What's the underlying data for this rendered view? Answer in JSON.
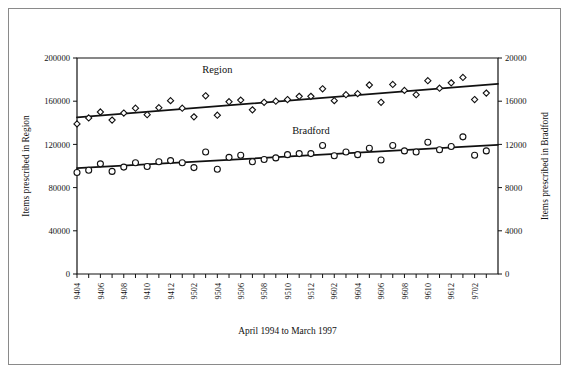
{
  "figure": {
    "xlabel": "April 1994 to March 1997",
    "ylabel_left": "Items prescribed in Region",
    "ylabel_right": "Items prescribed in Bradford",
    "series_label_region": "Region",
    "series_label_bradford": "Bradford",
    "border_color": "#8a8a8a",
    "ink_color": "#111111",
    "marker_fill": "#ffffff"
  },
  "chart_data": {
    "type": "scatter",
    "title": "",
    "subtitle": "",
    "xlabel": "April 1994 to March 1997",
    "ylabel": "Items prescribed in Region",
    "ylabel_secondary": "Items prescribed in Bradford",
    "grid": false,
    "legend_position": "inline-annotation",
    "ylim": [
      0,
      200000
    ],
    "ylim_secondary": [
      0,
      20000
    ],
    "ytick_labels": [
      "0",
      "40000",
      "80000",
      "120000",
      "160000",
      "200000"
    ],
    "ytick_values": [
      0,
      40000,
      80000,
      120000,
      160000,
      200000
    ],
    "ytick_labels_secondary": [
      "0",
      "4000",
      "8000",
      "12000",
      "16000",
      "20000"
    ],
    "ytick_values_secondary": [
      0,
      4000,
      8000,
      12000,
      16000,
      20000
    ],
    "x": [
      "9404",
      "9405",
      "9406",
      "9407",
      "9408",
      "9409",
      "9410",
      "9411",
      "9412",
      "9501",
      "9502",
      "9503",
      "9504",
      "9505",
      "9506",
      "9507",
      "9508",
      "9509",
      "9510",
      "9511",
      "9512",
      "9601",
      "9602",
      "9603",
      "9604",
      "9605",
      "9606",
      "9607",
      "9608",
      "9609",
      "9610",
      "9611",
      "9612",
      "9701",
      "9702",
      "9703"
    ],
    "xtick_labels": [
      "9404",
      "9406",
      "9408",
      "9410",
      "9412",
      "9502",
      "9504",
      "9506",
      "9508",
      "9510",
      "9512",
      "9602",
      "9604",
      "9606",
      "9608",
      "9610",
      "9612",
      "9702"
    ],
    "xtick_label_every": 2,
    "series": [
      {
        "name": "Region",
        "axis": "left",
        "marker": "diamond",
        "values": [
          139000,
          144500,
          150000,
          142500,
          149000,
          153500,
          147500,
          154000,
          160500,
          153500,
          145500,
          165000,
          147000,
          159500,
          161000,
          152000,
          159000,
          160000,
          161500,
          164500,
          164500,
          171500,
          160500,
          166000,
          167000,
          175000,
          159000,
          175500,
          170000,
          166000,
          179000,
          172000,
          177000,
          182000,
          161500,
          167500
        ],
        "trend_start": 145000,
        "trend_end": 176000
      },
      {
        "name": "Bradford",
        "axis": "right",
        "marker": "circle",
        "values": [
          9400,
          9600,
          10200,
          9500,
          9900,
          10300,
          9950,
          10400,
          10500,
          10300,
          9850,
          11300,
          9700,
          10800,
          11000,
          10400,
          10600,
          10750,
          11050,
          11150,
          11150,
          11900,
          10950,
          11300,
          11050,
          11650,
          10550,
          11900,
          11400,
          11300,
          12200,
          11500,
          11800,
          12700,
          11000,
          11400
        ],
        "trend_start": 9800,
        "trend_end": 11950
      }
    ],
    "annotations": [
      {
        "text": "Region",
        "x": "9504",
        "y": 186000
      },
      {
        "text": "Bradford",
        "x": "9512",
        "y": 130000
      }
    ]
  }
}
